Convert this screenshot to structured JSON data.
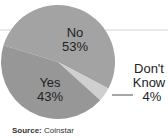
{
  "chart_data": {
    "type": "pie",
    "title": "",
    "categories": [
      "No",
      "Yes",
      "Don't Know"
    ],
    "values": [
      53,
      43,
      4
    ],
    "labels": [
      "No\n53%",
      "Yes\n43%",
      "Don't\nKnow\n4%"
    ],
    "colors": [
      "#a3a3a3",
      "#979797",
      "#cfcfcf"
    ],
    "source_label": "Source:",
    "source": "Coinstar"
  },
  "labels": {
    "no_name": "No",
    "no_pct": "53%",
    "yes_name": "Yes",
    "yes_pct": "43%",
    "dk_line1": "Don't",
    "dk_line2": "Know",
    "dk_pct": "4%"
  },
  "footer": {
    "source_label": "Source:",
    "source_value": "Coinstar"
  }
}
